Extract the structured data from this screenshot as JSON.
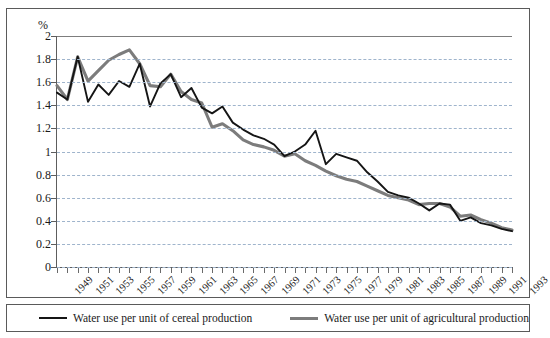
{
  "axis_unit_label": "%",
  "legend": {
    "entries": [
      {
        "key": "cereal",
        "label": "Water use per unit of cereal production",
        "color": "#151515"
      },
      {
        "key": "agricultural",
        "label": "Water use per unit of agricultural production",
        "color": "#7c7c7c"
      }
    ]
  },
  "chart_data": {
    "type": "line",
    "title": "",
    "subtitle": "",
    "xlabel": "",
    "ylabel": "%",
    "xlim": [
      1949,
      1993
    ],
    "ylim": [
      0,
      2
    ],
    "ytick_labels": [
      "0",
      "0.2",
      "0.4",
      "0.6",
      "0.8",
      "1",
      "1.2",
      "1.4",
      "1.6",
      "1.8",
      "2"
    ],
    "yticks": [
      0,
      0.2,
      0.4,
      0.6,
      0.8,
      1,
      1.2,
      1.4,
      1.6,
      1.8,
      2
    ],
    "grid": true,
    "legend_position": "bottom",
    "x": [
      1949,
      1950,
      1951,
      1952,
      1953,
      1954,
      1955,
      1956,
      1957,
      1958,
      1959,
      1960,
      1961,
      1962,
      1963,
      1964,
      1965,
      1966,
      1967,
      1968,
      1969,
      1970,
      1971,
      1972,
      1973,
      1974,
      1975,
      1976,
      1977,
      1978,
      1979,
      1980,
      1981,
      1982,
      1983,
      1984,
      1985,
      1986,
      1987,
      1988,
      1989,
      1990,
      1991,
      1992,
      1993
    ],
    "xtick_labels": [
      "1949",
      "1951",
      "1953",
      "1955",
      "1957",
      "1959",
      "1961",
      "1963",
      "1965",
      "1967",
      "1969",
      "1971",
      "1973",
      "1975",
      "1977",
      "1979",
      "1981",
      "1983",
      "1985",
      "1987",
      "1989",
      "1991",
      "1993"
    ],
    "series": [
      {
        "name": "Water use per unit of cereal production",
        "color": "#151515",
        "values": [
          1.51,
          1.45,
          1.82,
          1.43,
          1.58,
          1.49,
          1.61,
          1.56,
          1.76,
          1.39,
          1.59,
          1.67,
          1.47,
          1.55,
          1.38,
          1.33,
          1.39,
          1.25,
          1.19,
          1.14,
          1.11,
          1.06,
          0.96,
          1.0,
          1.06,
          1.18,
          0.89,
          0.98,
          0.95,
          0.92,
          0.82,
          0.74,
          0.65,
          0.62,
          0.6,
          0.55,
          0.49,
          0.55,
          0.54,
          0.4,
          0.43,
          0.38,
          0.36,
          0.33,
          0.31
        ]
      },
      {
        "name": "Water use per unit of agricultural production",
        "color": "#7c7c7c",
        "values": [
          1.57,
          1.45,
          1.82,
          1.61,
          1.7,
          1.79,
          1.84,
          1.88,
          1.76,
          1.57,
          1.56,
          1.67,
          1.52,
          1.45,
          1.42,
          1.21,
          1.24,
          1.18,
          1.1,
          1.06,
          1.04,
          1.01,
          0.96,
          0.98,
          0.92,
          0.88,
          0.83,
          0.79,
          0.76,
          0.74,
          0.7,
          0.66,
          0.62,
          0.6,
          0.58,
          0.54,
          0.55,
          0.55,
          0.52,
          0.44,
          0.45,
          0.41,
          0.38,
          0.34,
          0.32
        ]
      }
    ]
  }
}
